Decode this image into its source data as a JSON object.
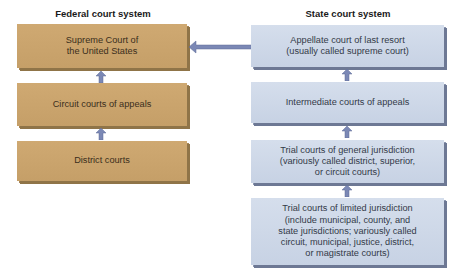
{
  "federal": {
    "heading": "Federal court system",
    "boxes": [
      {
        "label": "Supreme Court of\nthe United States"
      },
      {
        "label": "Circuit courts of appeals"
      },
      {
        "label": "District courts"
      }
    ]
  },
  "state": {
    "heading": "State court system",
    "boxes": [
      {
        "label": "Appellate court of last resort\n(usually called supreme court)"
      },
      {
        "label": "Intermediate courts of appeals"
      },
      {
        "label": "Trial courts of general jurisdiction\n(variously called district, superior,\nor circuit courts)"
      },
      {
        "label": "Trial courts of limited jurisdiction\n(include municipal, county, and\nstate jurisdictions; variously called\ncircuit, municipal, justice, district,\nor magistrate courts)"
      }
    ]
  },
  "colors": {
    "federal_box": "#c9a36c",
    "state_box": "#cdd7e7",
    "arrow": "#7b88b5"
  },
  "connections": [
    {
      "from": "District courts",
      "to": "Circuit courts of appeals",
      "direction": "up"
    },
    {
      "from": "Circuit courts of appeals",
      "to": "Supreme Court of the United States",
      "direction": "up"
    },
    {
      "from": "Trial courts of limited jurisdiction",
      "to": "Trial courts of general jurisdiction",
      "direction": "up"
    },
    {
      "from": "Trial courts of general jurisdiction",
      "to": "Intermediate courts of appeals",
      "direction": "up"
    },
    {
      "from": "Intermediate courts of appeals",
      "to": "Appellate court of last resort",
      "direction": "up"
    },
    {
      "from": "Appellate court of last resort",
      "to": "Supreme Court of the United States",
      "direction": "left"
    }
  ]
}
